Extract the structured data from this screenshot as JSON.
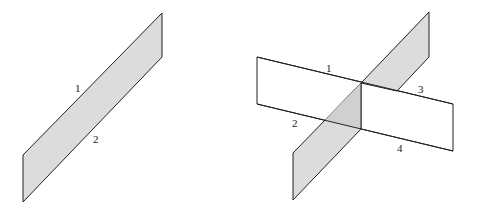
{
  "figure": {
    "left": {
      "description": "Single shaded vertical plane (wall)",
      "labels": [
        {
          "text": "1",
          "x": 78,
          "y": 92
        },
        {
          "text": "2",
          "x": 95,
          "y": 143
        }
      ]
    },
    "right": {
      "description": "Shaded vertical plane intersecting an unshaded horizontal plane",
      "labels": [
        {
          "text": "1",
          "x": 328,
          "y": 72
        },
        {
          "text": "2",
          "x": 293,
          "y": 127
        },
        {
          "text": "3",
          "x": 419,
          "y": 93
        },
        {
          "text": "4",
          "x": 398,
          "y": 152
        }
      ]
    },
    "colors": {
      "shade": "#dcdcdc",
      "stroke": "#222222"
    }
  }
}
